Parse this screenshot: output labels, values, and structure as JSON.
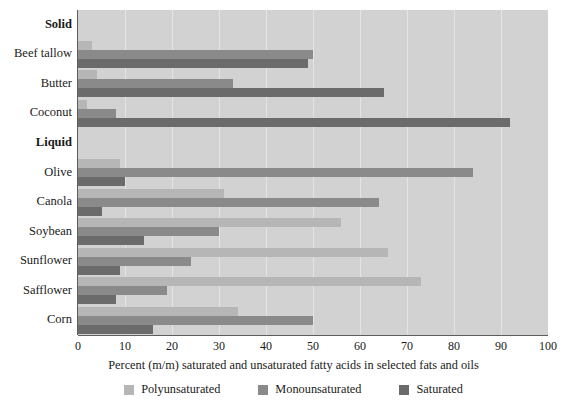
{
  "chart_data": {
    "type": "bar",
    "orientation": "horizontal",
    "title": "",
    "xlabel": "Percent (m/m) saturated and unsaturated fatty acids in selected fats and oils",
    "ylabel": "",
    "xlim": [
      0,
      100
    ],
    "xticks": [
      0,
      10,
      20,
      30,
      40,
      50,
      60,
      70,
      80,
      90,
      100
    ],
    "xtick_labels": [
      "0",
      "10",
      "20",
      "30",
      "40",
      "50",
      "60",
      "70",
      "80",
      "90",
      "100"
    ],
    "grid": true,
    "grid_axis": "x",
    "legend_position": "bottom",
    "group_headers": [
      "Solid",
      "Liquid"
    ],
    "categories": [
      "Beef tallow",
      "Butter",
      "Coconut",
      "Olive",
      "Canola",
      "Soybean",
      "Sunflower",
      "Safflower",
      "Corn"
    ],
    "series": [
      {
        "name": "Polyunsaturated",
        "color": "#b6b6b6",
        "values": [
          3,
          4,
          2,
          9,
          31,
          56,
          66,
          73,
          34
        ]
      },
      {
        "name": "Monounsaturated",
        "color": "#8a8a8a",
        "values": [
          50,
          33,
          8,
          84,
          64,
          30,
          24,
          19,
          50
        ]
      },
      {
        "name": "Saturated",
        "color": "#6b6b6b",
        "values": [
          49,
          65,
          92,
          10,
          5,
          14,
          9,
          8,
          16
        ]
      }
    ],
    "groups": [
      {
        "header": "Solid",
        "members": [
          "Beef tallow",
          "Butter",
          "Coconut"
        ]
      },
      {
        "header": "Liquid",
        "members": [
          "Olive",
          "Canola",
          "Soybean",
          "Sunflower",
          "Safflower",
          "Corn"
        ]
      }
    ]
  },
  "legend": {
    "items": [
      {
        "label": "Polyunsaturated",
        "color": "#b6b6b6"
      },
      {
        "label": "Monounsaturated",
        "color": "#8a8a8a"
      },
      {
        "label": "Saturated",
        "color": "#6b6b6b"
      }
    ]
  },
  "colors": {
    "plot_background": "#d2d2d2",
    "gridline": "#e4e4e4",
    "axis": "#5d5d5d",
    "text": "#1a1a1a",
    "page_background": "#ffffff"
  }
}
